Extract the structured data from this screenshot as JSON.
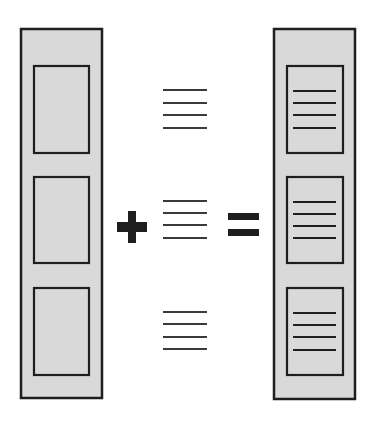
{
  "diagram": {
    "colors": {
      "background": "#ffffff",
      "panel_fill": "#d9d9d9",
      "stroke": "#1e1e1e",
      "line": "#3a3a3a"
    },
    "left_column": {
      "label": "empty-frames",
      "outer": {
        "x": 21,
        "y": 29,
        "w": 81,
        "h": 369
      },
      "frames": [
        {
          "x": 34,
          "y": 66,
          "w": 55,
          "h": 87
        },
        {
          "x": 34,
          "y": 177,
          "w": 55,
          "h": 86
        },
        {
          "x": 34,
          "y": 288,
          "w": 55,
          "h": 87
        }
      ]
    },
    "operator_plus": {
      "symbol": "+",
      "cx": 132,
      "cy": 227
    },
    "text_blocks": [
      {
        "x1": 163,
        "x2": 207,
        "lines_y": [
          90,
          103,
          115,
          128
        ]
      },
      {
        "x1": 163,
        "x2": 207,
        "lines_y": [
          201,
          213,
          225,
          238
        ]
      },
      {
        "x1": 163,
        "x2": 207,
        "lines_y": [
          312,
          324,
          337,
          349
        ]
      }
    ],
    "operator_equals": {
      "symbol": "=",
      "x": 228,
      "y": 213
    },
    "right_column": {
      "label": "filled-frames",
      "outer": {
        "x": 274,
        "y": 29,
        "w": 81,
        "h": 370
      },
      "frames": [
        {
          "x": 287,
          "y": 66,
          "w": 56,
          "h": 87,
          "lines_y": [
            91,
            103,
            115,
            128
          ]
        },
        {
          "x": 287,
          "y": 177,
          "w": 56,
          "h": 86,
          "lines_y": [
            202,
            214,
            226,
            238
          ]
        },
        {
          "x": 287,
          "y": 288,
          "w": 56,
          "h": 87,
          "lines_y": [
            313,
            325,
            337,
            350
          ]
        }
      ],
      "line_x1": 293,
      "line_x2": 336
    }
  }
}
